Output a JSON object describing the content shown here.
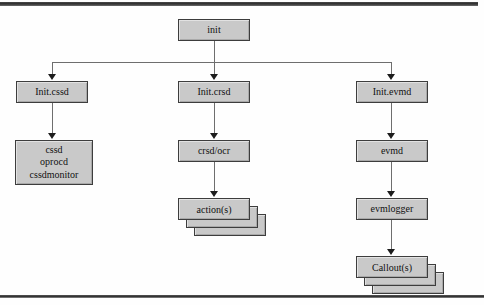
{
  "diagram": {
    "colors": {
      "node_fill": "#c9c9c9",
      "node_border": "#3d3d3d",
      "connector": "#6e6e6e",
      "arrowhead": "#1c1c1c",
      "background": "#fefefe",
      "rule": "#343434"
    },
    "root": {
      "label": "init"
    },
    "branches": [
      {
        "id": "cssd",
        "nodes": [
          {
            "label": "Init.cssd"
          },
          {
            "lines": [
              "cssd",
              "oprocd",
              "cssdmonitor"
            ]
          }
        ]
      },
      {
        "id": "crsd",
        "nodes": [
          {
            "label": "Init.crsd"
          },
          {
            "label": "crsd/ocr"
          },
          {
            "label": "action(s)",
            "stacked": 3
          }
        ]
      },
      {
        "id": "evmd",
        "nodes": [
          {
            "label": "Init.evmd"
          },
          {
            "label": "evmd"
          },
          {
            "label": "evmlogger"
          },
          {
            "label": "Callout(s)",
            "stacked": 3
          }
        ]
      }
    ]
  }
}
